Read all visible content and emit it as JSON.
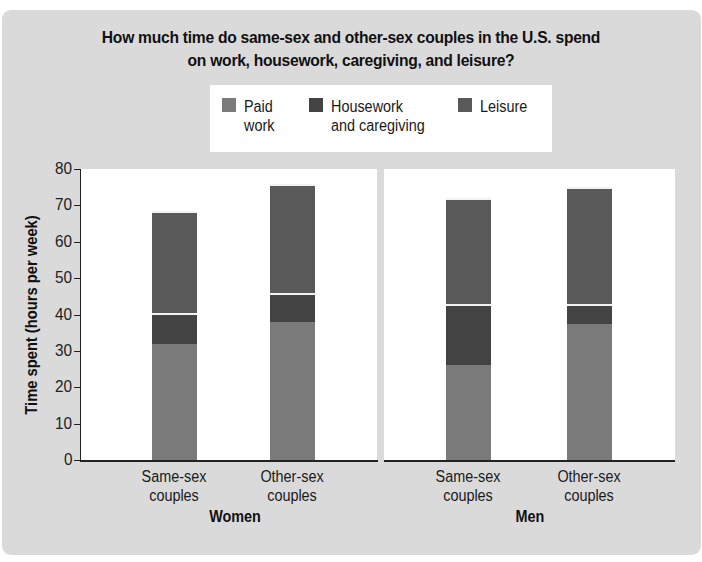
{
  "chart_data": {
    "type": "bar",
    "stacked": true,
    "title": "How much time do same-sex and other-sex couples in the U.S. spend on work, housework, caregiving, and leisure?",
    "title_lines": [
      "How much time do same-sex and other-sex couples in the U.S. spend",
      "on work, housework, caregiving, and leisure?"
    ],
    "ylabel": "Time spent (hours per week)",
    "xlabel": "",
    "ylim": [
      0,
      80
    ],
    "yticks": [
      0,
      10,
      20,
      30,
      40,
      50,
      60,
      70,
      80
    ],
    "grid": false,
    "legend_position": "top",
    "legend": [
      {
        "name": "Paid work",
        "lines": [
          "Paid",
          "work"
        ],
        "color": "#7a7a7a"
      },
      {
        "name": "Housework and caregiving",
        "lines": [
          "Housework",
          "and caregiving"
        ],
        "color": "#434343"
      },
      {
        "name": "Leisure",
        "lines": [
          "Leisure"
        ],
        "color": "#595959"
      }
    ],
    "groups": [
      {
        "name": "Women",
        "categories": [
          {
            "label": "Same-sex couples",
            "lines": [
              "Same-sex",
              "couples"
            ],
            "values": {
              "Paid work": 32,
              "Housework and caregiving": 8.5,
              "Leisure": 28
            },
            "total": 68.5
          },
          {
            "label": "Other-sex couples",
            "lines": [
              "Other-sex",
              "couples"
            ],
            "values": {
              "Paid work": 38,
              "Housework and caregiving": 8,
              "Leisure": 30
            },
            "total": 76
          }
        ]
      },
      {
        "name": "Men",
        "categories": [
          {
            "label": "Same-sex couples",
            "lines": [
              "Same-sex",
              "couples"
            ],
            "values": {
              "Paid work": 26,
              "Housework and caregiving": 17,
              "Leisure": 29
            },
            "total": 72
          },
          {
            "label": "Other-sex couples",
            "lines": [
              "Other-sex",
              "couples"
            ],
            "values": {
              "Paid work": 37.5,
              "Housework and caregiving": 5.5,
              "Leisure": 32
            },
            "total": 75
          }
        ]
      }
    ]
  }
}
